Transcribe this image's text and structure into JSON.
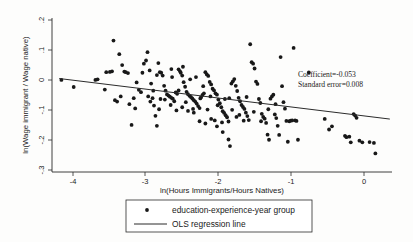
{
  "chart_data": {
    "type": "scatter",
    "title": "",
    "xlabel": "ln(Hours Immigrants/Hours Natives)",
    "ylabel": "ln(Wage immigrant / Wage native)",
    "xlim": [
      -4.35,
      0.35
    ],
    "ylim": [
      -0.32,
      0.22
    ],
    "xticks": [
      -4,
      -3,
      -2,
      -1,
      0
    ],
    "xticklabels": [
      "-4",
      "-3",
      "-2",
      "-1",
      "0"
    ],
    "yticks": [
      0.2,
      0.1,
      0,
      -0.1,
      -0.2,
      -0.3
    ],
    "yticklabels": [
      ".2",
      ".1",
      "0",
      "-.1",
      "-.2",
      "-.3"
    ],
    "grid": false,
    "legend_position": "below-axes",
    "annotations": [
      "Coefficient=-0.053",
      "Standard error=0.008"
    ],
    "series": [
      {
        "name": "education-experience-year group",
        "marker": "dot",
        "color": "#181818",
        "points": [
          [
            -4.22,
            0.003
          ],
          [
            -4.05,
            -0.022
          ],
          [
            -3.75,
            0.003
          ],
          [
            -3.72,
            0.005
          ],
          [
            -3.62,
            -0.031
          ],
          [
            -3.55,
            0.031
          ],
          [
            -3.52,
            0.033
          ],
          [
            -3.5,
            0.141
          ],
          [
            -3.48,
            -0.068
          ],
          [
            -3.45,
            -0.073
          ],
          [
            -3.42,
            0.093
          ],
          [
            -3.38,
            0.055
          ],
          [
            -3.35,
            0.032
          ],
          [
            -3.33,
            0.03
          ],
          [
            -3.3,
            0.027
          ],
          [
            -3.28,
            -0.082
          ],
          [
            -3.25,
            -0.155
          ],
          [
            -3.22,
            -0.061
          ],
          [
            -3.18,
            -0.006
          ],
          [
            -3.15,
            -0.032
          ],
          [
            -3.12,
            -0.04
          ],
          [
            -3.08,
            0.06
          ],
          [
            -3.05,
            0.071
          ],
          [
            -3.03,
            0.1
          ],
          [
            -3.0,
            0.036
          ],
          [
            -2.98,
            -0.01
          ],
          [
            -2.96,
            -0.061
          ],
          [
            -2.94,
            -0.087
          ],
          [
            -2.92,
            -0.123
          ],
          [
            -2.9,
            -0.158
          ],
          [
            -2.88,
            0.062
          ],
          [
            -2.86,
            0.03
          ],
          [
            -2.84,
            0.028
          ],
          [
            -2.82,
            0.018
          ],
          [
            -2.8,
            -0.018
          ],
          [
            -2.78,
            -0.035
          ],
          [
            -2.76,
            -0.048
          ],
          [
            -2.74,
            -0.052
          ],
          [
            -2.72,
            -0.056
          ],
          [
            -2.7,
            -0.06
          ],
          [
            -2.68,
            -0.063
          ],
          [
            -2.66,
            -0.072
          ],
          [
            -2.64,
            -0.041
          ],
          [
            -2.62,
            -0.046
          ],
          [
            -2.6,
            0.04
          ],
          [
            -2.58,
            0.033
          ],
          [
            -2.57,
            0.028
          ],
          [
            -2.55,
            0.018
          ],
          [
            -2.53,
            -0.005
          ],
          [
            -2.51,
            -0.021
          ],
          [
            -2.49,
            -0.039
          ],
          [
            -2.47,
            -0.047
          ],
          [
            -2.45,
            -0.053
          ],
          [
            -2.43,
            -0.057
          ],
          [
            -2.41,
            -0.062
          ],
          [
            -2.39,
            -0.068
          ],
          [
            -2.37,
            -0.073
          ],
          [
            -2.35,
            -0.08
          ],
          [
            -2.33,
            -0.089
          ],
          [
            -2.31,
            -0.096
          ],
          [
            -2.29,
            -0.058
          ],
          [
            -2.27,
            -0.05
          ],
          [
            -2.25,
            -0.044
          ],
          [
            -2.23,
            0.03
          ],
          [
            -2.21,
            0.022
          ],
          [
            -2.19,
            0.017
          ],
          [
            -2.17,
            -0.004
          ],
          [
            -2.15,
            -0.013
          ],
          [
            -2.13,
            -0.028
          ],
          [
            -2.11,
            -0.034
          ],
          [
            -2.09,
            -0.044
          ],
          [
            -2.07,
            -0.049
          ],
          [
            -2.05,
            -0.066
          ],
          [
            -2.03,
            -0.079
          ],
          [
            -2.01,
            -0.093
          ],
          [
            -1.99,
            -0.107
          ],
          [
            -1.97,
            -0.113
          ],
          [
            -1.95,
            -0.121
          ],
          [
            -1.93,
            -0.128
          ],
          [
            -1.91,
            -0.206
          ],
          [
            -1.89,
            -0.229
          ],
          [
            -1.87,
            -0.01
          ],
          [
            -1.85,
            -0.002
          ],
          [
            -1.83,
            0.006
          ],
          [
            -1.81,
            -0.018
          ],
          [
            -1.79,
            -0.036
          ],
          [
            -1.77,
            -0.06
          ],
          [
            -1.75,
            -0.072
          ],
          [
            -1.73,
            -0.085
          ],
          [
            -1.71,
            -0.092
          ],
          [
            -1.69,
            -0.099
          ],
          [
            -1.67,
            -0.112
          ],
          [
            -1.65,
            -0.124
          ],
          [
            -1.63,
            -0.138
          ],
          [
            -1.61,
            0.128
          ],
          [
            -1.59,
            0.065
          ],
          [
            -1.57,
            0.06
          ],
          [
            -1.55,
            0.043
          ],
          [
            -1.53,
            -0.003
          ],
          [
            -1.51,
            -0.011
          ],
          [
            -1.49,
            -0.064
          ],
          [
            -1.47,
            -0.078
          ],
          [
            -1.45,
            -0.116
          ],
          [
            -1.43,
            -0.127
          ],
          [
            -1.41,
            -0.133
          ],
          [
            -1.39,
            -0.148
          ],
          [
            -1.37,
            -0.189
          ],
          [
            -1.35,
            -0.207
          ],
          [
            -1.33,
            -0.063
          ],
          [
            -1.31,
            -0.055
          ],
          [
            -1.29,
            -0.049
          ],
          [
            -1.27,
            -0.118
          ],
          [
            -1.25,
            -0.131
          ],
          [
            -1.23,
            -0.158
          ],
          [
            -1.21,
            -0.19
          ],
          [
            -1.19,
            0.083
          ],
          [
            -1.17,
            -0.019
          ],
          [
            -1.15,
            -0.075
          ],
          [
            -1.13,
            -0.098
          ],
          [
            -1.11,
            -0.141
          ],
          [
            -1.09,
            -0.214
          ],
          [
            -1.07,
            -0.142
          ],
          [
            -1.05,
            -0.14
          ],
          [
            -1.03,
            -0.139
          ],
          [
            -1.01,
            0.115
          ],
          [
            -0.99,
            -0.139
          ],
          [
            -0.97,
            -0.141
          ],
          [
            -0.95,
            -0.207
          ],
          [
            -0.8,
            0.029
          ],
          [
            -0.58,
            -0.134
          ],
          [
            -0.52,
            -0.171
          ],
          [
            -0.48,
            -0.16
          ],
          [
            -0.3,
            -0.193
          ],
          [
            -0.28,
            -0.198
          ],
          [
            -0.24,
            -0.196
          ],
          [
            -0.22,
            -0.216
          ],
          [
            -0.18,
            -0.117
          ],
          [
            -0.16,
            -0.122
          ],
          [
            -0.14,
            -0.13
          ],
          [
            -0.1,
            -0.21
          ],
          [
            -0.06,
            -0.216
          ],
          [
            0.04,
            -0.215
          ],
          [
            0.1,
            -0.218
          ],
          [
            0.12,
            -0.255
          ],
          [
            -3.6,
            0.03
          ],
          [
            -3.4,
            -0.055
          ],
          [
            -3.2,
            -0.097
          ],
          [
            -2.99,
            -0.073
          ],
          [
            -2.85,
            -0.064
          ],
          [
            -2.69,
            0.013
          ],
          [
            -2.54,
            0.049
          ],
          [
            -2.44,
            0.005
          ],
          [
            -2.36,
            0.013
          ],
          [
            -2.26,
            -0.019
          ],
          [
            -2.16,
            -0.055
          ],
          [
            -2.06,
            -0.086
          ],
          [
            -1.96,
            -0.064
          ],
          [
            -1.86,
            -0.102
          ],
          [
            -1.76,
            -0.12
          ],
          [
            -1.66,
            -0.057
          ],
          [
            -1.56,
            -0.109
          ],
          [
            -1.46,
            -0.142
          ],
          [
            -1.36,
            -0.1
          ],
          [
            -1.26,
            -0.082
          ],
          [
            -2.9,
            0.02
          ],
          [
            -2.7,
            0.041
          ],
          [
            -2.6,
            -0.034
          ],
          [
            -2.5,
            -0.075
          ],
          [
            -2.4,
            -0.099
          ],
          [
            -2.3,
            -0.062
          ],
          [
            -2.2,
            -0.101
          ],
          [
            -2.1,
            -0.139
          ],
          [
            -2.0,
            -0.146
          ],
          [
            -1.9,
            -0.061
          ],
          [
            -1.8,
            -0.127
          ],
          [
            -1.7,
            -0.14
          ],
          [
            -3.1,
            0.028
          ],
          [
            -3.02,
            -0.055
          ],
          [
            -2.95,
            -0.035
          ],
          [
            -2.87,
            -0.1
          ],
          [
            -2.79,
            -0.066
          ],
          [
            -2.71,
            -0.085
          ],
          [
            -2.63,
            -0.104
          ],
          [
            -2.55,
            -0.093
          ],
          [
            -2.47,
            -0.106
          ],
          [
            -2.39,
            -0.112
          ],
          [
            -2.31,
            -0.142
          ],
          [
            -2.23,
            -0.15
          ],
          [
            -2.15,
            -0.134
          ],
          [
            -2.07,
            -0.16
          ],
          [
            -1.99,
            -0.18
          ],
          [
            -1.91,
            -0.143
          ]
        ]
      },
      {
        "name": "OLS regression line",
        "marker": "line",
        "color": "#2b2b2b",
        "slope": -0.053,
        "intercept": -0.1175,
        "x_start": -4.25,
        "x_end": 0.32,
        "y_start": 0.0078,
        "y_end": -0.1344
      }
    ]
  },
  "annotation_block": {
    "coefficient_label": "Coefficient=-0.053",
    "standard_error_label": "Standard error=0.008"
  },
  "axes": {
    "x_title": "ln(Hours Immigrants/Hours Natives)",
    "y_title": "ln(Wage immigrant / Wage native)",
    "x_tick_labels": [
      "-4",
      "-3",
      "-2",
      "-1",
      "0"
    ],
    "y_tick_labels": [
      ".2",
      ".1",
      "0",
      "-.1",
      "-.2",
      "-.3"
    ]
  },
  "legend": {
    "entries": [
      {
        "label": "education-experience-year group",
        "marker": "dot"
      },
      {
        "label": "OLS regression line",
        "marker": "line"
      }
    ]
  }
}
